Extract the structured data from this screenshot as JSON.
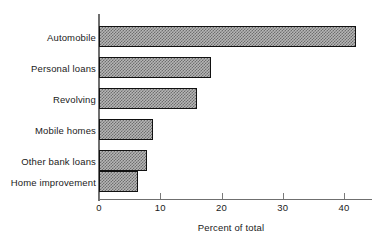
{
  "chart_data": {
    "type": "bar",
    "orientation": "horizontal",
    "title": "",
    "subtitle": "",
    "xlabel": "Percent of total",
    "ylabel": "",
    "categories": [
      "Automobile",
      "Personal loans",
      "Revolving",
      "Mobile homes",
      "Other bank loans",
      "Home improvement"
    ],
    "values": [
      42.0,
      18.3,
      16.0,
      8.8,
      7.8,
      6.4
    ],
    "xlim": [
      0,
      44.5
    ],
    "xticks": [
      0,
      10,
      20,
      30,
      40
    ],
    "xtick_labels": [
      "0",
      "10",
      "20",
      "30",
      "40"
    ],
    "grid": false,
    "legend": null,
    "bar_fill": "#b6b6b6",
    "bar_hatch": "checkered",
    "bar_edge_color": "#111111",
    "axis_color": "#6f6f6f",
    "background": "#ffffff"
  }
}
